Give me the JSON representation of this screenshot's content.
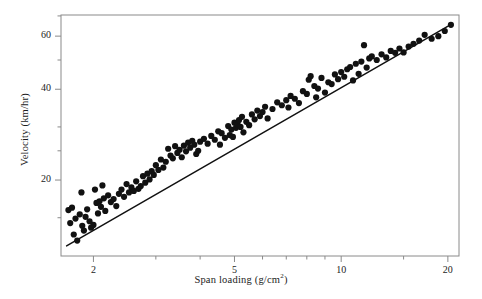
{
  "figure": {
    "background": "#ffffff",
    "frame_color": "#8a8a8a",
    "ink_color": "#111111"
  },
  "chart_data": {
    "type": "scatter",
    "title": "",
    "subtitle": "",
    "xlabel": "Span loading (g/cm²)",
    "xlabel_base": "Span loading (g/cm",
    "xlabel_sup": "2",
    "xlabel_tail": ")",
    "ylabel": "Velocity (km/hr)",
    "xscale": "log",
    "yscale": "log",
    "xlim": [
      1.62,
      21.5
    ],
    "ylim": [
      11.2,
      70.5
    ],
    "grid": false,
    "legend": null,
    "xticks": [
      2,
      5,
      10,
      20
    ],
    "xticklabels": [
      "2",
      "5",
      "10",
      "20"
    ],
    "xminorticks": [
      3,
      4,
      6,
      7,
      8,
      9,
      15
    ],
    "yticks": [
      20,
      40,
      60
    ],
    "yticklabels": [
      "20",
      "40",
      "60"
    ],
    "yminorticks": [
      15,
      25,
      30,
      50,
      70
    ],
    "marker": "filled-circle",
    "marker_size_px": 3.1,
    "fit_line": {
      "label": "least-squares fit",
      "x": [
        1.68,
        20.6
      ],
      "y": [
        12.1,
        66.0
      ],
      "slope_loglog": 0.673,
      "width_px": 1.5
    },
    "points": [
      [
        1.7,
        15.9
      ],
      [
        1.72,
        14.4
      ],
      [
        1.74,
        16.2
      ],
      [
        1.76,
        13.2
      ],
      [
        1.78,
        14.9
      ],
      [
        1.8,
        12.6
      ],
      [
        1.83,
        15.4
      ],
      [
        1.85,
        18.2
      ],
      [
        1.86,
        14.1
      ],
      [
        1.88,
        13.6
      ],
      [
        1.9,
        15.1
      ],
      [
        1.92,
        16.0
      ],
      [
        1.95,
        14.6
      ],
      [
        1.97,
        13.9
      ],
      [
        2.0,
        14.2
      ],
      [
        2.02,
        18.6
      ],
      [
        2.04,
        16.8
      ],
      [
        2.06,
        15.5
      ],
      [
        2.08,
        17.0
      ],
      [
        2.1,
        16.3
      ],
      [
        2.12,
        19.2
      ],
      [
        2.14,
        17.4
      ],
      [
        2.16,
        15.8
      ],
      [
        2.2,
        17.8
      ],
      [
        2.24,
        16.9
      ],
      [
        2.28,
        17.3
      ],
      [
        2.32,
        16.4
      ],
      [
        2.36,
        18.0
      ],
      [
        2.4,
        18.6
      ],
      [
        2.44,
        17.6
      ],
      [
        2.48,
        19.4
      ],
      [
        2.52,
        18.2
      ],
      [
        2.56,
        18.9
      ],
      [
        2.6,
        18.4
      ],
      [
        2.64,
        19.8
      ],
      [
        2.68,
        18.7
      ],
      [
        2.72,
        19.1
      ],
      [
        2.76,
        20.6
      ],
      [
        2.8,
        19.6
      ],
      [
        2.84,
        21.0
      ],
      [
        2.88,
        20.1
      ],
      [
        2.92,
        21.4
      ],
      [
        2.96,
        20.8
      ],
      [
        3.0,
        22.4
      ],
      [
        3.05,
        21.6
      ],
      [
        3.1,
        23.4
      ],
      [
        3.15,
        22.0
      ],
      [
        3.2,
        23.0
      ],
      [
        3.25,
        25.4
      ],
      [
        3.3,
        24.1
      ],
      [
        3.35,
        23.6
      ],
      [
        3.4,
        25.9
      ],
      [
        3.45,
        24.6
      ],
      [
        3.5,
        25.2
      ],
      [
        3.55,
        23.8
      ],
      [
        3.6,
        26.0
      ],
      [
        3.65,
        24.9
      ],
      [
        3.7,
        26.6
      ],
      [
        3.75,
        25.6
      ],
      [
        3.8,
        27.0
      ],
      [
        3.85,
        26.2
      ],
      [
        3.9,
        24.4
      ],
      [
        3.95,
        25.0
      ],
      [
        4.0,
        26.8
      ],
      [
        4.1,
        27.4
      ],
      [
        4.2,
        26.4
      ],
      [
        4.3,
        28.0
      ],
      [
        4.4,
        27.2
      ],
      [
        4.5,
        29.0
      ],
      [
        4.55,
        26.2
      ],
      [
        4.6,
        28.6
      ],
      [
        4.7,
        27.6
      ],
      [
        4.8,
        30.2
      ],
      [
        4.85,
        28.2
      ],
      [
        4.9,
        29.4
      ],
      [
        4.95,
        27.8
      ],
      [
        5.0,
        31.0
      ],
      [
        5.05,
        29.8
      ],
      [
        5.1,
        30.6
      ],
      [
        5.15,
        31.6
      ],
      [
        5.2,
        30.0
      ],
      [
        5.25,
        32.4
      ],
      [
        5.3,
        28.8
      ],
      [
        5.4,
        31.2
      ],
      [
        5.5,
        30.4
      ],
      [
        5.6,
        33.0
      ],
      [
        5.7,
        31.8
      ],
      [
        5.8,
        34.0
      ],
      [
        5.9,
        32.6
      ],
      [
        6.0,
        33.6
      ],
      [
        6.1,
        35.0
      ],
      [
        6.2,
        32.0
      ],
      [
        6.4,
        34.4
      ],
      [
        6.6,
        36.2
      ],
      [
        6.8,
        35.4
      ],
      [
        7.0,
        36.8
      ],
      [
        7.1,
        34.8
      ],
      [
        7.2,
        38.0
      ],
      [
        7.4,
        37.2
      ],
      [
        7.6,
        36.0
      ],
      [
        7.8,
        39.4
      ],
      [
        8.0,
        38.6
      ],
      [
        8.1,
        43.0
      ],
      [
        8.2,
        44.2
      ],
      [
        8.4,
        41.0
      ],
      [
        8.5,
        37.6
      ],
      [
        8.6,
        40.2
      ],
      [
        8.8,
        43.6
      ],
      [
        9.0,
        39.0
      ],
      [
        9.2,
        42.2
      ],
      [
        9.4,
        41.6
      ],
      [
        9.6,
        44.8
      ],
      [
        9.8,
        43.2
      ],
      [
        10.0,
        45.6
      ],
      [
        10.2,
        44.0
      ],
      [
        10.4,
        46.6
      ],
      [
        10.6,
        47.4
      ],
      [
        10.8,
        42.8
      ],
      [
        11.0,
        48.6
      ],
      [
        11.2,
        45.0
      ],
      [
        11.4,
        49.4
      ],
      [
        11.6,
        56.0
      ],
      [
        11.8,
        47.2
      ],
      [
        12.0,
        50.6
      ],
      [
        12.2,
        51.4
      ],
      [
        12.6,
        50.0
      ],
      [
        13.0,
        52.2
      ],
      [
        13.4,
        51.0
      ],
      [
        13.8,
        53.6
      ],
      [
        14.2,
        52.8
      ],
      [
        14.6,
        54.6
      ],
      [
        15.0,
        53.0
      ],
      [
        15.5,
        55.4
      ],
      [
        16.0,
        56.6
      ],
      [
        16.6,
        58.0
      ],
      [
        17.2,
        60.6
      ],
      [
        18.0,
        58.8
      ],
      [
        18.8,
        60.0
      ],
      [
        19.6,
        62.4
      ],
      [
        20.4,
        65.4
      ]
    ]
  }
}
